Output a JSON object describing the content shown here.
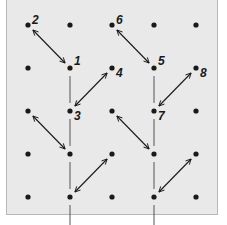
{
  "diagram": {
    "title": "",
    "grid": {
      "columns": 5,
      "rows": 5
    },
    "colors": {
      "panel": "#e9e9e9",
      "border": "#b8b8b8",
      "ink": "#1a1a1a"
    },
    "labels": [
      {
        "text": "2",
        "col": 0,
        "row": 0
      },
      {
        "text": "1",
        "col": 1,
        "row": 1
      },
      {
        "text": "4",
        "col": 2,
        "row": 1
      },
      {
        "text": "3",
        "col": 1,
        "row": 2
      },
      {
        "text": "6",
        "col": 2,
        "row": 0
      },
      {
        "text": "5",
        "col": 3,
        "row": 1
      },
      {
        "text": "8",
        "col": 4,
        "row": 1
      },
      {
        "text": "7",
        "col": 3,
        "row": 2
      }
    ],
    "arrows": [
      {
        "from": [
          0,
          0
        ],
        "to": [
          1,
          1
        ]
      },
      {
        "from": [
          2,
          1
        ],
        "to": [
          1,
          2
        ]
      },
      {
        "from": [
          2,
          0
        ],
        "to": [
          3,
          1
        ]
      },
      {
        "from": [
          4,
          1
        ],
        "to": [
          3,
          2
        ]
      },
      {
        "from": [
          0,
          2
        ],
        "to": [
          1,
          3
        ]
      },
      {
        "from": [
          2,
          3
        ],
        "to": [
          1,
          4
        ]
      },
      {
        "from": [
          2,
          2
        ],
        "to": [
          3,
          3
        ]
      },
      {
        "from": [
          4,
          3
        ],
        "to": [
          3,
          4
        ]
      }
    ],
    "vertical_lines": [
      {
        "col": 1,
        "segments": [
          [
            1,
            2
          ],
          [
            2,
            3
          ],
          [
            3,
            4
          ],
          [
            4,
            5
          ]
        ]
      },
      {
        "col": 3,
        "segments": [
          [
            1,
            2
          ],
          [
            2,
            3
          ],
          [
            3,
            4
          ],
          [
            4,
            5
          ]
        ]
      }
    ]
  }
}
